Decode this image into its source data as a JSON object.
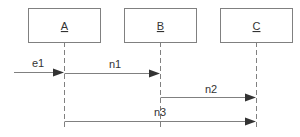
{
  "diagram": {
    "type": "sequence",
    "objects": [
      {
        "id": "A",
        "label": "A"
      },
      {
        "id": "B",
        "label": "B"
      },
      {
        "id": "C",
        "label": "C"
      }
    ],
    "messages": [
      {
        "label": "e1",
        "from": null,
        "to": "A"
      },
      {
        "label": "n1",
        "from": "A",
        "to": "B"
      },
      {
        "label": "n2",
        "from": "B",
        "to": "C"
      },
      {
        "label": "n3",
        "from": "A",
        "to": "C"
      }
    ]
  }
}
